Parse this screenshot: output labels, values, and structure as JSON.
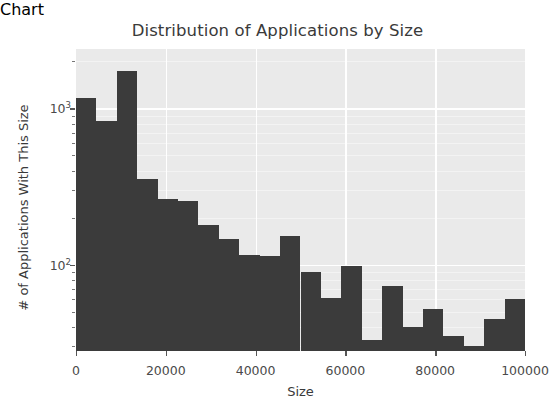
{
  "chart_data": {
    "type": "bar",
    "title": "Distribution of Applications by Size",
    "xlabel": "Size",
    "ylabel": "# of Applications With This Size",
    "xlim": [
      0,
      100000
    ],
    "ylim": [
      28,
      2400
    ],
    "yscale": "log",
    "grid": true,
    "legend": null,
    "bar_color": "#3b3b3b",
    "plot_bgcolor": "#eaeaea",
    "grid_color": "#ffffff",
    "bin_width": 4545,
    "xticks": [
      {
        "value": 0,
        "label": "0"
      },
      {
        "value": 20000,
        "label": "20000"
      },
      {
        "value": 40000,
        "label": "40000"
      },
      {
        "value": 60000,
        "label": "60000"
      },
      {
        "value": 80000,
        "label": "80000"
      },
      {
        "value": 100000,
        "label": "100000"
      }
    ],
    "yticks": [
      {
        "value": 100,
        "label": "10",
        "exp": "2"
      },
      {
        "value": 1000,
        "label": "10",
        "exp": "3"
      }
    ],
    "bins": [
      {
        "x0": 0,
        "x1": 4545,
        "value": 1170
      },
      {
        "x0": 4545,
        "x1": 9091,
        "value": 830
      },
      {
        "x0": 9091,
        "x1": 13636,
        "value": 1740
      },
      {
        "x0": 13636,
        "x1": 18182,
        "value": 355
      },
      {
        "x0": 18182,
        "x1": 22727,
        "value": 265
      },
      {
        "x0": 22727,
        "x1": 27273,
        "value": 255
      },
      {
        "x0": 27273,
        "x1": 31818,
        "value": 180
      },
      {
        "x0": 31818,
        "x1": 36364,
        "value": 145
      },
      {
        "x0": 36364,
        "x1": 40909,
        "value": 115
      },
      {
        "x0": 40909,
        "x1": 45455,
        "value": 113
      },
      {
        "x0": 45455,
        "x1": 50000,
        "value": 152
      },
      {
        "x0": 50000,
        "x1": 54545,
        "value": 90
      },
      {
        "x0": 54545,
        "x1": 59091,
        "value": 61
      },
      {
        "x0": 59091,
        "x1": 63636,
        "value": 98
      },
      {
        "x0": 63636,
        "x1": 68182,
        "value": 33
      },
      {
        "x0": 68182,
        "x1": 72727,
        "value": 73
      },
      {
        "x0": 72727,
        "x1": 77273,
        "value": 40
      },
      {
        "x0": 77273,
        "x1": 81818,
        "value": 52
      },
      {
        "x0": 81818,
        "x1": 86364,
        "value": 35
      },
      {
        "x0": 86364,
        "x1": 90909,
        "value": 30
      },
      {
        "x0": 90909,
        "x1": 95455,
        "value": 45
      },
      {
        "x0": 95455,
        "x1": 100000,
        "value": 60
      }
    ]
  }
}
